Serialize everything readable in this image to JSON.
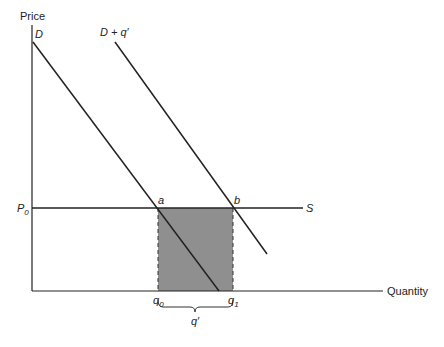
{
  "diagram": {
    "y_axis_label": "Price",
    "x_axis_label": "Quantity",
    "demand_label": "D",
    "shifted_demand_label": "D + q′",
    "supply_label": "S",
    "price_label": "P",
    "price_sub": "0",
    "point_a": "a",
    "point_b": "b",
    "q0_label": "q",
    "q0_sub": "0",
    "q1_label": "q",
    "q1_sub": "1",
    "brace_label": "q′",
    "colors": {
      "line": "#222222",
      "shade": "#8f8f8f"
    }
  }
}
